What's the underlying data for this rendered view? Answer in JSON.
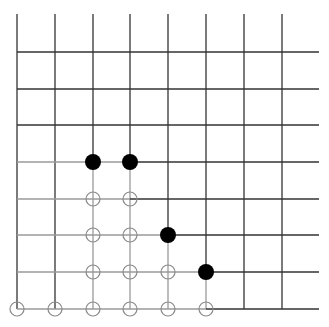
{
  "diagram": {
    "type": "go-board-corner",
    "width": 329,
    "height": 327,
    "colors": {
      "background": "#ffffff",
      "grid_dark": "#333333",
      "grid_light": "#9a9a9a",
      "black_stone": "#000000",
      "empty_marker": "#8a8a8a"
    },
    "grid": {
      "vertical_x": [
        17,
        55,
        93,
        130,
        168,
        206,
        244,
        282
      ],
      "vertical_top_y": 14,
      "horizontal_y": [
        52,
        89,
        125,
        162,
        199,
        235,
        272,
        309
      ],
      "horizontal_left_x": 17,
      "horizontal_right_x": 319
    },
    "black_stones": [
      {
        "x": 93,
        "y": 162
      },
      {
        "x": 130,
        "y": 162
      },
      {
        "x": 168,
        "y": 235
      },
      {
        "x": 206,
        "y": 272
      }
    ],
    "empty_circles": [
      {
        "x": 93,
        "y": 199
      },
      {
        "x": 130,
        "y": 199
      },
      {
        "x": 93,
        "y": 235
      },
      {
        "x": 130,
        "y": 235
      },
      {
        "x": 93,
        "y": 272
      },
      {
        "x": 130,
        "y": 272
      },
      {
        "x": 168,
        "y": 272
      },
      {
        "x": 17,
        "y": 309
      },
      {
        "x": 55,
        "y": 309
      },
      {
        "x": 93,
        "y": 309
      },
      {
        "x": 130,
        "y": 309
      },
      {
        "x": 168,
        "y": 309
      },
      {
        "x": 206,
        "y": 309
      }
    ],
    "stone_radius": 8,
    "circle_radius": 7
  }
}
